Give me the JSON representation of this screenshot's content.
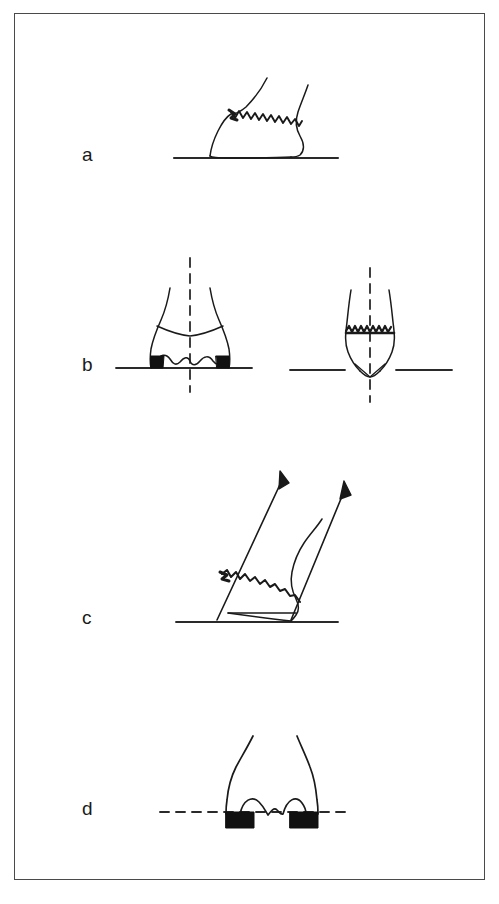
{
  "figure": {
    "type": "line-drawing",
    "kind": "orthopaedic-illustration",
    "background_color": "#ffffff",
    "ink_color": "#1a1a1a",
    "frame_color": "#4a4a4a",
    "frame": {
      "x": 14,
      "y": 13,
      "width": 471,
      "height": 867
    },
    "panels": [
      {
        "id": "a",
        "label": "a",
        "label_x": 82,
        "label_y": 145,
        "description": "Lateral view of bone resting on a solid horizontal ground line with an oblique zigzag fracture line",
        "ground_line": {
          "style": "solid",
          "x1": 174,
          "y1": 158,
          "x2": 338,
          "y2": 158
        },
        "fracture_line": {
          "style": "zigzag",
          "orientation": "oblique"
        },
        "subfigures": 1
      },
      {
        "id": "b",
        "label": "b",
        "label_x": 82,
        "label_y": 355,
        "description": "Two frontal views with vertical dashed axis lines; left shows black wedge fragments on solid ground line, right shows a horizontal zigzag fracture and a V-shaped notch",
        "ground_line": {
          "style": "solid"
        },
        "axis_line": {
          "style": "dashed",
          "orientation": "vertical"
        },
        "subfigures": 2
      },
      {
        "id": "c",
        "label": "c",
        "label_x": 82,
        "label_y": 608,
        "description": "Oblique view with two upward-pointing arrows indicating force direction, oblique zigzag fracture line and solid ground line",
        "ground_line": {
          "style": "solid",
          "x1": 176,
          "y1": 622,
          "x2": 338,
          "y2": 622
        },
        "arrows": 2,
        "arrow_direction": "up-right",
        "subfigures": 1
      },
      {
        "id": "d",
        "label": "d",
        "label_x": 82,
        "label_y": 799,
        "description": "Frontal view with a horizontal dashed reference line and two black filled blocks at the base",
        "reference_line": {
          "style": "dashed",
          "x1": 160,
          "y1": 812,
          "x2": 352,
          "y2": 812
        },
        "blocks": 2,
        "subfigures": 1
      }
    ]
  }
}
